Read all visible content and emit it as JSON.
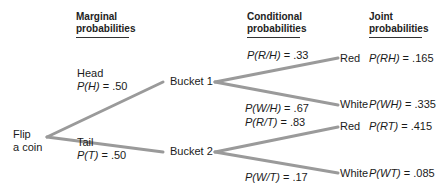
{
  "headers": {
    "marginal": [
      "Marginal",
      "probabilities"
    ],
    "conditional": [
      "Conditional",
      "probabilities"
    ],
    "joint": [
      "Joint",
      "probabilities"
    ]
  },
  "root": {
    "label_line1": "Flip",
    "label_line2": "a coin"
  },
  "coin": {
    "head": {
      "label": "Head",
      "prob_var": "P(H)",
      "prob_val": ".50"
    },
    "tail": {
      "label": "Tail",
      "prob_var": "P(T)",
      "prob_val": ".50"
    }
  },
  "buckets": {
    "bucket1": "Bucket 1",
    "bucket2": "Bucket 2"
  },
  "conditional": {
    "r_given_h": {
      "expr": "P(R/H)",
      "val": ".33"
    },
    "w_given_h": {
      "expr": "P(W/H)",
      "val": ".67"
    },
    "r_given_t": {
      "expr": "P(R/T)",
      "val": ".83"
    },
    "w_given_t": {
      "expr": "P(W/T)",
      "val": ".17"
    }
  },
  "outcomes": {
    "rh": {
      "color": "Red",
      "expr": "P(RH)",
      "val": ".165"
    },
    "wh": {
      "color": "White",
      "expr": "P(WH)",
      "val": ".335"
    },
    "rt": {
      "color": "Red",
      "expr": "P(RT)",
      "val": ".415"
    },
    "wt": {
      "color": "White",
      "expr": "P(WT)",
      "val": ".085"
    }
  },
  "style": {
    "branch_color": "#9a9a9a"
  }
}
